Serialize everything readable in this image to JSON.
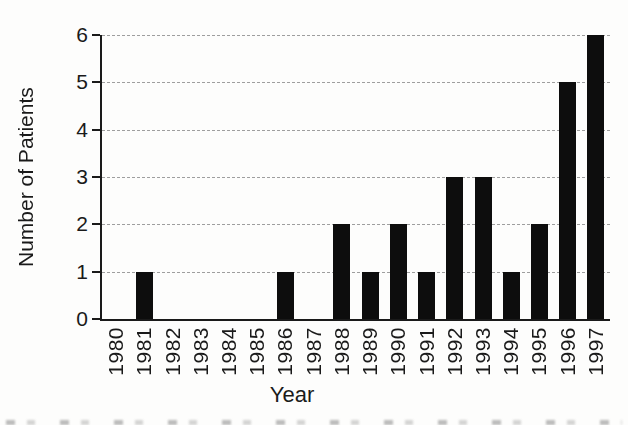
{
  "chart_data": {
    "type": "bar",
    "title": "",
    "xlabel": "Year",
    "ylabel": "Number of Patients",
    "categories": [
      "1980",
      "1981",
      "1982",
      "1983",
      "1984",
      "1985",
      "1986",
      "1987",
      "1988",
      "1989",
      "1990",
      "1991",
      "1992",
      "1993",
      "1994",
      "1995",
      "1996",
      "1997"
    ],
    "values": [
      0,
      1,
      0,
      0,
      0,
      0,
      1,
      0,
      2,
      1,
      2,
      1,
      3,
      3,
      1,
      2,
      5,
      6
    ],
    "ylim": [
      0,
      6
    ],
    "yticks": [
      0,
      1,
      2,
      3,
      4,
      5,
      6
    ],
    "grid": "horizontal-dashed",
    "legend": "none",
    "colors": {
      "bar": "#0d0d0d",
      "axis": "#1a1a1a",
      "grid": "#9e9e9e",
      "text": "#1a1a1a",
      "background": "#fdfdfc"
    }
  }
}
